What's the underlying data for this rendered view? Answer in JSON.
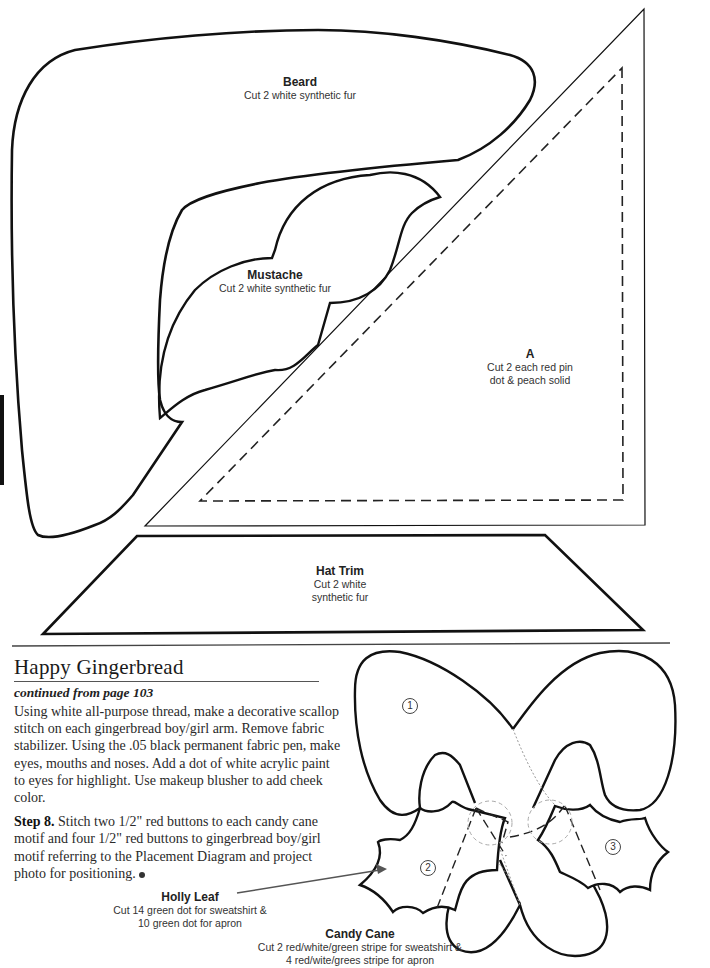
{
  "patterns": {
    "beard": {
      "title": "Beard",
      "subtitle": "Cut 2 white synthetic fur"
    },
    "mustache": {
      "title": "Mustache",
      "subtitle": "Cut 2 white synthetic fur"
    },
    "piece_a": {
      "title": "A",
      "subtitle_line1": "Cut 2 each red pin",
      "subtitle_line2": "dot & peach solid"
    },
    "hat_trim": {
      "title": "Hat Trim",
      "subtitle_line1": "Cut 2 white",
      "subtitle_line2": "synthetic fur"
    }
  },
  "article": {
    "title": "Happy Gingerbread",
    "continued": "continued from page 103",
    "paragraph1": "Using white all-purpose thread, make a decorative scallop stitch on each gingerbread boy/girl arm. Remove fabric stabilizer. Using the .05 black permanent fabric pen, make eyes, mouths and noses. Add a dot of white acrylic paint to eyes for highlight. Use makeup blusher to add cheek color.",
    "step_label": "Step 8.",
    "step_text": " Stitch two 1/2\" red buttons to each candy cane motif and four 1/2\" red buttons to gingerbread boy/girl motif referring to the Placement Diagram and project photo for positioning."
  },
  "diagram": {
    "markers": [
      "1",
      "2",
      "3"
    ],
    "holly_leaf": {
      "title": "Holly Leaf",
      "line1": "Cut 14 green dot for sweatshirt &",
      "line2": "10 green dot for apron"
    },
    "candy_cane": {
      "title": "Candy Cane",
      "line1": "Cut 2 red/white/green stripe for sweatshirt &",
      "line2": "4 red/wite/grees stripe for apron"
    }
  }
}
